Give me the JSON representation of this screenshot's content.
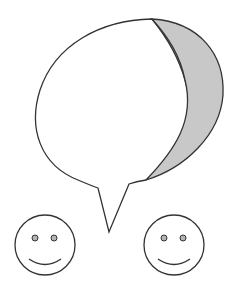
{
  "diagram": {
    "colors": {
      "stroke": "#333333",
      "bubble_fill": "#ffffff",
      "shaded_region_fill": "#c8c8c8",
      "eye_fill": "#b4b4b4",
      "background": "#ffffff"
    },
    "elements": [
      {
        "name": "speech-bubble",
        "shaded_part": "right crescent"
      },
      {
        "name": "smiley-face-left"
      },
      {
        "name": "smiley-face-right"
      }
    ]
  }
}
